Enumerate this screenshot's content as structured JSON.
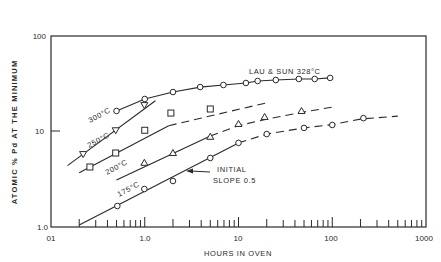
{
  "chart_data": {
    "type": "line",
    "title": "",
    "xlabel": "HOURS IN OVEN",
    "ylabel": "ATOMIC % Pd AT THE MINIMUM",
    "xscale": "log",
    "yscale": "log",
    "xlim": [
      0.1,
      1000
    ],
    "ylim": [
      1.0,
      100
    ],
    "x_tick_labels": [
      "01",
      "1.0",
      "10",
      "100",
      "1000"
    ],
    "x_tick_values": [
      0.1,
      1,
      10,
      100,
      1000
    ],
    "y_tick_labels": [
      "1.0",
      "10",
      "100"
    ],
    "y_tick_values": [
      1,
      10,
      100
    ],
    "grid": false,
    "legend": "none (series labeled inline)",
    "series": [
      {
        "name": "LAU & SUN 328°C",
        "label": "LAU & SUN 328°C",
        "marker": "circle",
        "line": "solid",
        "x": [
          0.5,
          1.0,
          2.0,
          3.9,
          6.9,
          12,
          16,
          25,
          44,
          65,
          95
        ],
        "y": [
          16.4,
          21.9,
          25.9,
          29.2,
          30.7,
          32.2,
          33.8,
          34.6,
          35.5,
          35.5,
          36.4
        ]
      },
      {
        "name": "300°C",
        "label": "300°C",
        "marker": "triangle-down",
        "line": "solid",
        "x": [
          0.22,
          0.49,
          0.99
        ],
        "y": [
          5.8,
          10.3,
          18.9
        ],
        "fit_line": {
          "x": [
            0.15,
            1.3
          ],
          "y": [
            4.4,
            21
          ]
        }
      },
      {
        "name": "250°C",
        "label": "250°C",
        "marker": "square",
        "line": "solid then dashed",
        "x": [
          0.26,
          0.49,
          1.0,
          1.9,
          5.0
        ],
        "y": [
          4.25,
          5.95,
          10.3,
          15.6,
          17.2
        ],
        "fit_line": {
          "x": [
            0.2,
            1.8,
            20
          ],
          "y": [
            3.7,
            11.5,
            20
          ]
        }
      },
      {
        "name": "200°C",
        "label": "200°C",
        "marker": "triangle-up",
        "line": "solid then dashed",
        "x": [
          0.99,
          2.0,
          5.0,
          10,
          19,
          47
        ],
        "y": [
          4.7,
          5.95,
          8.8,
          12.0,
          14.2,
          16.4
        ],
        "fit_line": {
          "x": [
            0.5,
            5,
            10,
            20,
            50,
            100
          ],
          "y": [
            3.1,
            9.0,
            11.5,
            13.5,
            16,
            18
          ]
        }
      },
      {
        "name": "175°C",
        "label": "175°C",
        "marker": "circle",
        "line": "solid then dashed",
        "x": [
          0.51,
          0.99,
          2.0,
          5.0,
          10,
          20,
          50,
          100,
          215
        ],
        "y": [
          1.66,
          2.5,
          3.03,
          5.28,
          7.6,
          9.4,
          10.9,
          11.7,
          13.8
        ],
        "fit_line": {
          "x": [
            0.2,
            10,
            20,
            50,
            100,
            200,
            500
          ],
          "y": [
            1.05,
            7.6,
            9.4,
            10.9,
            11.8,
            13.5,
            14.5
          ]
        }
      }
    ],
    "annotations": [
      {
        "text": "INITIAL",
        "at": [
          13,
          2.6
        ]
      },
      {
        "text": "SLOPE 0.5",
        "at": [
          13,
          2.1
        ],
        "arrow_to": [
          3.5,
          4.2
        ]
      }
    ]
  },
  "labels": {
    "xlabel": "HOURS IN OVEN",
    "ylabel": "ATOMIC % Pd AT THE MINIMUM",
    "x_ticks": [
      "01",
      "1.0",
      "10",
      "100",
      "1000"
    ],
    "y_ticks": [
      "1.0",
      "10",
      "100"
    ],
    "series_lau": "LAU & SUN 328°C",
    "series_300": "300°C",
    "series_250": "250°C",
    "series_200": "200°C",
    "series_175": "175°C",
    "annotation_line1": "INITIAL",
    "annotation_line2": "SLOPE 0.5"
  }
}
